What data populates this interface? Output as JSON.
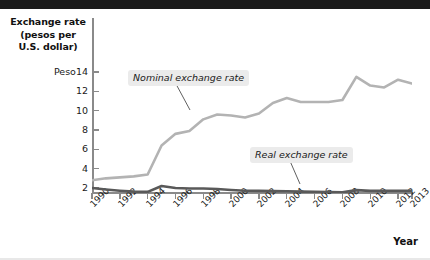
{
  "figure": {
    "y_axis_title_lines": [
      "Exchange rate",
      "(pesos per",
      "U.S. dollar)"
    ],
    "x_axis_title": "Year"
  },
  "chart_data": {
    "type": "line",
    "title": "",
    "subtitle": "",
    "xlabel": "Year",
    "ylabel": "Exchange rate (pesos per U.S. dollar)",
    "xlim": [
      1990,
      2013
    ],
    "ylim": [
      0,
      15
    ],
    "grid": false,
    "legend_position": "inline-annotations",
    "x_tick_labels": [
      "1990",
      "1992",
      "1994",
      "1996",
      "1998",
      "2000",
      "2002",
      "2004",
      "2006",
      "2008",
      "2010",
      "2012",
      "2013"
    ],
    "x_tick_values": [
      1990,
      1992,
      1994,
      1996,
      1998,
      2000,
      2002,
      2004,
      2006,
      2008,
      2010,
      2012,
      2013
    ],
    "y_tick_labels": [
      "2",
      "4",
      "6",
      "8",
      "10",
      "12",
      "Peso14"
    ],
    "y_tick_values": [
      2,
      4,
      6,
      8,
      10,
      12,
      14
    ],
    "x": [
      1990,
      1991,
      1992,
      1993,
      1994,
      1995,
      1996,
      1997,
      1998,
      1999,
      2000,
      2001,
      2002,
      2003,
      2004,
      2005,
      2006,
      2007,
      2008,
      2009,
      2010,
      2011,
      2012,
      2013
    ],
    "series": [
      {
        "name": "Nominal exchange rate",
        "color": "#b3b3b3",
        "annotation": "Nominal exchange rate",
        "values": [
          2.8,
          3.0,
          3.1,
          3.2,
          3.4,
          6.4,
          7.6,
          7.9,
          9.1,
          9.6,
          9.5,
          9.3,
          9.7,
          10.8,
          11.3,
          10.9,
          10.9,
          10.9,
          11.1,
          13.5,
          12.6,
          12.4,
          13.2,
          12.8
        ]
      },
      {
        "name": "Real exchange rate",
        "color": "#595959",
        "annotation": "Real exchange rate",
        "values": [
          2.0,
          1.85,
          1.72,
          1.62,
          1.6,
          2.2,
          2.0,
          1.95,
          1.95,
          1.9,
          1.8,
          1.72,
          1.7,
          1.68,
          1.66,
          1.62,
          1.6,
          1.58,
          1.55,
          1.78,
          1.7,
          1.7,
          1.72,
          1.7
        ]
      }
    ]
  }
}
